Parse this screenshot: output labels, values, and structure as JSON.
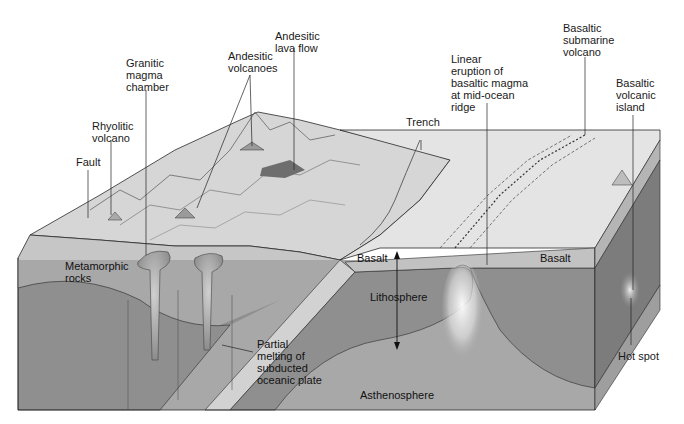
{
  "diagram": {
    "type": "block-diagram",
    "colors": {
      "background": "#ffffff",
      "surface_land": "#d9d9d9",
      "surface_ocean_floor": "#e2e2e2",
      "metamorphic_crust": "#c4c4c4",
      "basalt_layer": "#bdbdbd",
      "lithosphere": "#8f8f8f",
      "asthenosphere": "#a6a6a6",
      "side_face_dark": "#7a7a7a",
      "side_face_light": "#9a9a9a",
      "magma_plume": "#f2f2f2",
      "line": "#2a2a2a"
    },
    "labels": {
      "andesitic_lava_flow": "Andesitic\nlava flow",
      "granitic_magma_chamber": "Granitic\nmagma\nchamber",
      "andesitic_volcanoes": "Andesitic\nvolcanoes",
      "rhyolitic_volcano": "Rhyolitic\nvolcano",
      "fault": "Fault",
      "trench": "Trench",
      "linear_eruption": "Linear\neruption of\nbasaltic magma\nat mid-ocean\nridge",
      "basaltic_submarine_volcano": "Basaltic\nsubmarine\nvolcano",
      "basaltic_volcanic_island": "Basaltic\nvolcanic\nisland",
      "metamorphic_rocks": "Metamorphic\nrocks",
      "partial_melting": "Partial\nmelting of\nsubducted\noceanic plate",
      "basalt_left": "Basalt",
      "basalt_right": "Basalt",
      "lithosphere": "Lithosphere",
      "asthenosphere": "Asthenosphere",
      "hot_spot": "Hot spot"
    }
  }
}
